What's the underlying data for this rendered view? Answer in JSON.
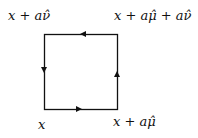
{
  "diagram": {
    "type": "plaquette",
    "labels": {
      "top_left": "x + aν̂",
      "top_right": "x + aμ̂ + aν̂",
      "bottom_left": "x",
      "bottom_right": "x + aμ̂"
    },
    "square": {
      "left": 44,
      "top": 34,
      "right": 117,
      "bottom": 109
    },
    "arrows": [
      {
        "edge": "bottom",
        "direction": "right"
      },
      {
        "edge": "right",
        "direction": "up"
      },
      {
        "edge": "top",
        "direction": "left"
      },
      {
        "edge": "left",
        "direction": "down"
      }
    ],
    "line_color": "#111111"
  }
}
